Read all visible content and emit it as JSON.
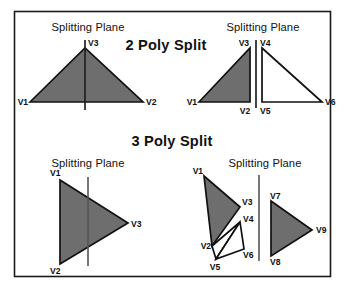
{
  "figure": {
    "background_color": "#ffffff",
    "border_color": "#1a1a1a",
    "fill_color": "#6e6e6e",
    "outline_color": "#111111",
    "plane_color": "#555555",
    "headings": {
      "two_poly": "2 Poly Split",
      "three_poly": "3 Poly Split"
    },
    "panels": [
      {
        "id": "top-left",
        "plane_label": "Splitting Plane",
        "vertices": [
          {
            "name": "V1",
            "label": "V1"
          },
          {
            "name": "V2",
            "label": "V2"
          },
          {
            "name": "V3",
            "label": "V3"
          }
        ]
      },
      {
        "id": "top-right",
        "plane_label": "Splitting Plane",
        "vertices": [
          {
            "name": "V1",
            "label": "V1"
          },
          {
            "name": "V2",
            "label": "V2"
          },
          {
            "name": "V3",
            "label": "V3"
          },
          {
            "name": "V4",
            "label": "V4"
          },
          {
            "name": "V5",
            "label": "V5"
          },
          {
            "name": "V6",
            "label": "V6"
          }
        ]
      },
      {
        "id": "bottom-left",
        "plane_label": "Splitting Plane",
        "vertices": [
          {
            "name": "V1",
            "label": "V1"
          },
          {
            "name": "V2",
            "label": "V2"
          },
          {
            "name": "V3",
            "label": "V3"
          }
        ]
      },
      {
        "id": "bottom-right",
        "plane_label": "Splitting Plane",
        "vertices": [
          {
            "name": "V1",
            "label": "V1"
          },
          {
            "name": "V2",
            "label": "V2"
          },
          {
            "name": "V3",
            "label": "V3"
          },
          {
            "name": "V4",
            "label": "V4"
          },
          {
            "name": "V5",
            "label": "V5"
          },
          {
            "name": "V6",
            "label": "V6"
          },
          {
            "name": "V7",
            "label": "V7"
          },
          {
            "name": "V8",
            "label": "V8"
          },
          {
            "name": "V9",
            "label": "V9"
          }
        ]
      }
    ]
  }
}
